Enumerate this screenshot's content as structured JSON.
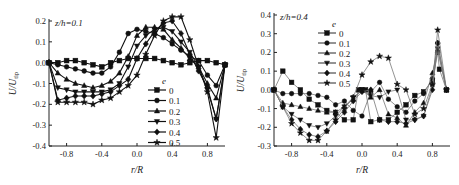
{
  "chart_data": [
    {
      "type": "line",
      "annotation": "z/h=0.1",
      "xlabel": "r/R",
      "ylabel": "U/U_tip",
      "xlim": [
        -1.0,
        1.0
      ],
      "ylim": [
        -0.4,
        0.2
      ],
      "xticks": [
        "-0.8",
        "-0.4",
        "0.0",
        "0.4",
        "0.8"
      ],
      "yticks": [
        "0.2",
        "0.1",
        "0.0",
        "-0.1",
        "-0.2",
        "-0.3",
        "-0.4"
      ],
      "legend_title": "e",
      "legend_position": "lower-center-right",
      "grid": false,
      "x": [
        -1.0,
        -0.9,
        -0.8,
        -0.7,
        -0.6,
        -0.5,
        -0.4,
        -0.3,
        -0.2,
        -0.1,
        0.0,
        0.1,
        0.2,
        0.3,
        0.4,
        0.5,
        0.6,
        0.7,
        0.8,
        0.9,
        1.0
      ],
      "series": [
        {
          "name": "0",
          "marker": "square",
          "values": [
            0.0,
            0.0,
            0.01,
            0.01,
            0.0,
            -0.01,
            -0.02,
            0.0,
            0.01,
            0.02,
            0.02,
            0.02,
            0.02,
            0.01,
            0.0,
            -0.01,
            0.0,
            0.01,
            0.01,
            0.0,
            -0.01
          ]
        },
        {
          "name": "0.1",
          "marker": "circle",
          "values": [
            0.0,
            -0.01,
            -0.02,
            -0.03,
            -0.04,
            -0.05,
            -0.05,
            -0.02,
            0.05,
            0.14,
            0.16,
            0.15,
            0.14,
            0.12,
            0.09,
            0.06,
            0.03,
            0.01,
            -0.06,
            -0.11,
            -0.01
          ]
        },
        {
          "name": "0.2",
          "marker": "triangle-up",
          "values": [
            0.0,
            -0.05,
            -0.08,
            -0.1,
            -0.11,
            -0.12,
            -0.11,
            -0.09,
            -0.05,
            0.03,
            0.13,
            0.17,
            0.17,
            0.16,
            0.11,
            0.07,
            0.02,
            -0.02,
            -0.1,
            -0.17,
            -0.01
          ]
        },
        {
          "name": "0.3",
          "marker": "triangle-down",
          "values": [
            0.0,
            -0.12,
            -0.13,
            -0.14,
            -0.14,
            -0.14,
            -0.14,
            -0.13,
            -0.1,
            -0.02,
            0.08,
            0.13,
            0.16,
            0.17,
            0.15,
            0.1,
            0.05,
            -0.02,
            -0.13,
            -0.27,
            -0.01
          ]
        },
        {
          "name": "0.4",
          "marker": "diamond",
          "values": [
            0.0,
            -0.18,
            -0.17,
            -0.16,
            -0.16,
            -0.16,
            -0.15,
            -0.14,
            -0.11,
            -0.08,
            0.02,
            0.09,
            0.15,
            0.19,
            0.2,
            0.14,
            0.04,
            -0.04,
            -0.12,
            -0.27,
            -0.01
          ]
        },
        {
          "name": "0.5",
          "marker": "star",
          "values": [
            0.0,
            -0.19,
            -0.19,
            -0.19,
            -0.19,
            -0.2,
            -0.18,
            -0.17,
            -0.14,
            -0.11,
            -0.06,
            0.04,
            0.13,
            0.2,
            0.22,
            0.22,
            0.11,
            -0.02,
            -0.14,
            -0.36,
            -0.01
          ]
        }
      ]
    },
    {
      "type": "line",
      "annotation": "z/h=0.4",
      "xlabel": "r/R",
      "ylabel": "U/U_tip",
      "xlim": [
        -1.0,
        1.0
      ],
      "ylim": [
        -0.3,
        0.4
      ],
      "xticks": [
        "-0.8",
        "-0.4",
        "0.0",
        "0.4",
        "0.8"
      ],
      "yticks": [
        "0.4",
        "0.3",
        "0.2",
        "0.1",
        "0.0",
        "-0.1",
        "-0.2",
        "-0.3"
      ],
      "legend_title": "e",
      "legend_position": "upper-left",
      "grid": false,
      "series": [
        {
          "name": "0",
          "marker": "square",
          "x": [
            -1.0,
            -0.9,
            -0.8,
            -0.7,
            -0.6,
            -0.5,
            -0.4,
            -0.3,
            -0.2,
            -0.1,
            -0.04,
            0.0,
            0.04,
            0.1,
            0.2,
            0.3,
            0.4,
            0.5,
            0.6,
            0.7,
            0.8,
            0.86,
            0.88,
            0.96
          ],
          "values": [
            0.0,
            0.1,
            0.04,
            0.0,
            -0.05,
            -0.08,
            -0.11,
            -0.12,
            -0.16,
            -0.16,
            0.0,
            0.0,
            0.0,
            -0.17,
            -0.16,
            -0.16,
            -0.12,
            -0.08,
            -0.03,
            -0.01,
            0.05,
            0.2,
            0.11,
            0.0
          ]
        },
        {
          "name": "0.1",
          "marker": "circle",
          "x": [
            -1.0,
            -0.9,
            -0.8,
            -0.7,
            -0.6,
            -0.5,
            -0.4,
            -0.3,
            -0.2,
            -0.1,
            0.0,
            0.1,
            0.2,
            0.3,
            0.4,
            0.5,
            0.6,
            0.7,
            0.8,
            0.86,
            0.96
          ],
          "values": [
            0.0,
            -0.02,
            -0.02,
            -0.02,
            -0.02,
            -0.03,
            -0.04,
            -0.08,
            -0.06,
            -0.11,
            -0.14,
            -0.01,
            0.04,
            -0.05,
            -0.09,
            -0.12,
            -0.06,
            -0.02,
            0.06,
            0.25,
            0.0
          ]
        },
        {
          "name": "0.2",
          "marker": "triangle-up",
          "x": [
            -1.0,
            -0.9,
            -0.8,
            -0.7,
            -0.6,
            -0.5,
            -0.4,
            -0.3,
            -0.2,
            -0.1,
            0.0,
            0.1,
            0.2,
            0.3,
            0.4,
            0.5,
            0.6,
            0.7,
            0.8,
            0.86,
            0.96
          ],
          "values": [
            0.0,
            -0.07,
            -0.08,
            -0.09,
            -0.1,
            -0.11,
            -0.12,
            -0.12,
            -0.09,
            -0.05,
            0.0,
            -0.04,
            0.0,
            -0.13,
            -0.15,
            -0.19,
            -0.12,
            -0.07,
            0.09,
            0.21,
            0.0
          ]
        },
        {
          "name": "0.3",
          "marker": "triangle-down",
          "x": [
            -1.0,
            -0.9,
            -0.8,
            -0.7,
            -0.6,
            -0.5,
            -0.4,
            -0.3,
            -0.2,
            -0.1,
            0.0,
            0.1,
            0.2,
            0.3,
            0.4,
            0.5,
            0.6,
            0.7,
            0.8,
            0.86,
            0.96
          ],
          "values": [
            0.0,
            -0.09,
            -0.13,
            -0.16,
            -0.19,
            -0.2,
            -0.18,
            -0.14,
            -0.09,
            -0.04,
            0.0,
            -0.03,
            -0.04,
            -0.01,
            0.0,
            -0.16,
            -0.16,
            -0.14,
            0.02,
            0.22,
            0.0
          ]
        },
        {
          "name": "0.4",
          "marker": "diamond",
          "x": [
            -1.0,
            -0.9,
            -0.8,
            -0.7,
            -0.6,
            -0.5,
            -0.4,
            -0.3,
            -0.2,
            -0.1,
            0.0,
            0.1,
            0.2,
            0.3,
            0.4,
            0.5,
            0.6,
            0.7,
            0.8,
            0.86,
            0.96
          ],
          "values": [
            0.0,
            -0.09,
            -0.16,
            -0.21,
            -0.24,
            -0.25,
            -0.22,
            -0.17,
            -0.12,
            -0.06,
            -0.01,
            0.0,
            -0.16,
            -0.17,
            -0.17,
            -0.18,
            -0.16,
            -0.14,
            0.0,
            0.25,
            0.0
          ]
        },
        {
          "name": "0.5",
          "marker": "star",
          "x": [
            -1.0,
            -0.9,
            -0.8,
            -0.7,
            -0.6,
            -0.5,
            -0.4,
            -0.3,
            -0.2,
            -0.1,
            0.0,
            0.1,
            0.2,
            0.3,
            0.4,
            0.5,
            0.6,
            0.7,
            0.8,
            0.86,
            0.96
          ],
          "values": [
            0.0,
            -0.09,
            -0.18,
            -0.23,
            -0.27,
            -0.27,
            -0.22,
            -0.16,
            -0.1,
            -0.04,
            0.08,
            0.15,
            0.18,
            0.17,
            0.03,
            0.0,
            -0.13,
            -0.1,
            0.03,
            0.32,
            0.0
          ]
        }
      ]
    }
  ],
  "labels": {
    "left_annotation": "z/h=0.1",
    "right_annotation": "z/h=0.4",
    "xlabel": "r/R",
    "ylabel_main": "U/U",
    "ylabel_sub": "tip",
    "legend_title": "e"
  }
}
